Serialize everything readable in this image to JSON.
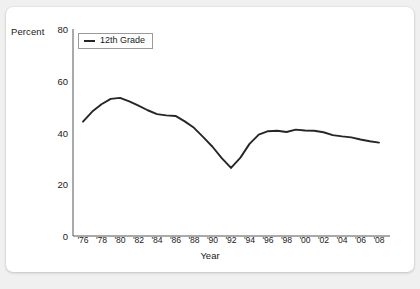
{
  "card": {
    "background_color": "#ffffff",
    "page_background_color": "#f0f0f0"
  },
  "legend": {
    "entries": [
      {
        "label": "12th Grade",
        "color": "#262626"
      }
    ]
  },
  "axes": {
    "y_title": "Percent",
    "x_title": "Year",
    "y_ticks": [
      "0",
      "20",
      "40",
      "60",
      "80"
    ],
    "x_ticks": [
      "'76",
      "'78",
      "'80",
      "'82",
      "'84",
      "'86",
      "'88",
      "'90",
      "'92",
      "'94",
      "'96",
      "'98",
      "'00",
      "'02",
      "'04",
      "'06",
      "'08"
    ]
  },
  "chart_data": {
    "type": "line",
    "title": "",
    "subtitle": "",
    "xlabel": "Year",
    "ylabel": "Percent",
    "ylim": [
      0,
      80
    ],
    "xlim": [
      1976,
      2008
    ],
    "grid": false,
    "legend_position": "top-left",
    "x_tick_labels": [
      "'76",
      "'78",
      "'80",
      "'82",
      "'84",
      "'86",
      "'88",
      "'90",
      "'92",
      "'94",
      "'96",
      "'98",
      "'00",
      "'02",
      "'04",
      "'06",
      "'08"
    ],
    "y_tick_values": [
      0,
      20,
      40,
      60,
      80
    ],
    "x": [
      1976,
      1977,
      1978,
      1979,
      1980,
      1981,
      1982,
      1983,
      1984,
      1985,
      1986,
      1987,
      1988,
      1989,
      1990,
      1991,
      1992,
      1993,
      1994,
      1995,
      1996,
      1997,
      1998,
      1999,
      2000,
      2001,
      2002,
      2003,
      2004,
      2005,
      2006,
      2007,
      2008
    ],
    "series": [
      {
        "name": "12th Grade",
        "color": "#262626",
        "values": [
          44.2,
          48.1,
          50.9,
          53.0,
          53.4,
          52.0,
          50.4,
          48.6,
          47.1,
          46.6,
          46.4,
          44.3,
          41.8,
          38.2,
          34.5,
          30.1,
          26.3,
          30.2,
          35.6,
          39.2,
          40.5,
          40.7,
          40.2,
          41.1,
          40.8,
          40.7,
          40.1,
          39.0,
          38.5,
          38.1,
          37.3,
          36.6,
          36.1
        ]
      }
    ]
  }
}
